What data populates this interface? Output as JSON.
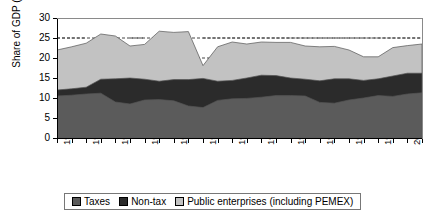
{
  "chart_data": {
    "type": "area",
    "title": "",
    "xlabel": "",
    "ylabel": "Share of GDP (%)",
    "ylim": [
      0,
      30
    ],
    "yticks": [
      0,
      5,
      10,
      15,
      20,
      25,
      30
    ],
    "grid": "dashed horizontal gridlines at 20 and 25",
    "gridlines": [
      20,
      25
    ],
    "legend_position": "bottom",
    "stacked": true,
    "x": [
      1977,
      1978,
      1979,
      1980,
      1981,
      1982,
      1983,
      1984,
      1985,
      1986,
      1987,
      1988,
      1989,
      1990,
      1991,
      1992,
      1993,
      1994,
      1995,
      1996,
      1997,
      1998,
      1999,
      2000,
      2001,
      2002
    ],
    "xtick_labels": [
      "1977",
      "1979",
      "1981",
      "1983",
      "1985",
      "1987",
      "1989",
      "1991",
      "1993",
      "1995",
      "1997",
      "1999",
      "2001"
    ],
    "series": [
      {
        "name": "Taxes",
        "color": "#5b5b5b",
        "values": [
          10.5,
          10.7,
          11.0,
          11.2,
          9.0,
          8.5,
          9.5,
          9.6,
          9.3,
          8.0,
          7.6,
          9.4,
          9.8,
          9.9,
          10.2,
          10.6,
          10.6,
          10.5,
          8.9,
          8.7,
          9.5,
          10.0,
          10.6,
          10.4,
          11.0,
          11.3
        ]
      },
      {
        "name": "Non-tax",
        "color": "#2b2b2b",
        "values": [
          1.5,
          1.6,
          1.7,
          3.5,
          5.8,
          6.5,
          5.2,
          4.6,
          5.3,
          6.6,
          7.3,
          4.8,
          4.6,
          5.1,
          5.5,
          5.0,
          4.4,
          4.2,
          5.4,
          6.1,
          5.3,
          4.4,
          4.2,
          5.1,
          5.2,
          4.9
        ]
      },
      {
        "name": "Public enterprises (including PEMEX)",
        "color": "#c2c2c2",
        "values": [
          10.0,
          10.5,
          11.0,
          11.3,
          10.7,
          8.0,
          8.7,
          12.5,
          11.8,
          12.0,
          3.2,
          8.6,
          9.6,
          8.5,
          8.3,
          8.3,
          8.9,
          8.3,
          8.5,
          8.1,
          7.2,
          5.9,
          5.5,
          7.1,
          6.9,
          7.3
        ]
      }
    ],
    "totals": [
      22.0,
      22.8,
      23.7,
      26.0,
      25.5,
      23.0,
      23.4,
      26.7,
      26.4,
      26.6,
      18.1,
      22.8,
      24.0,
      23.5,
      24.0,
      23.9,
      23.9,
      23.0,
      22.8,
      22.9,
      22.0,
      20.3,
      20.3,
      22.6,
      23.1,
      23.5
    ]
  },
  "axis": {
    "y_title": "Share of GDP (%)",
    "y_labels": [
      "30",
      "25",
      "20",
      "15",
      "10",
      "5",
      "0"
    ],
    "x_labels": [
      "1977",
      "1979",
      "1981",
      "1983",
      "1985",
      "1987",
      "1989",
      "1991",
      "1993",
      "1995",
      "1997",
      "1999",
      "2001"
    ]
  },
  "legend": {
    "items": [
      {
        "label": "Taxes",
        "color": "#5b5b5b"
      },
      {
        "label": "Non-tax",
        "color": "#2b2b2b"
      },
      {
        "label": "Public enterprises (including PEMEX)",
        "color": "#c2c2c2"
      }
    ]
  }
}
